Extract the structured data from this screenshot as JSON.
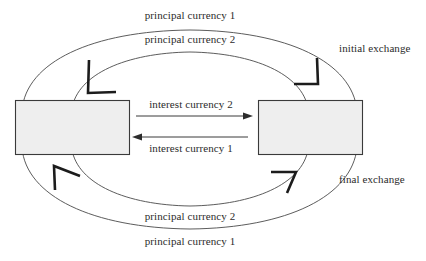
{
  "diagram": {
    "background_color": "#ffffff",
    "nodes": [
      {
        "id": "party-left",
        "label": "",
        "fill": "#eeeeee",
        "stroke": "#3a3a3a"
      },
      {
        "id": "party-right",
        "label": "",
        "fill": "#eeeeee",
        "stroke": "#3a3a3a"
      }
    ],
    "labels": {
      "top_outer": "principal currency 1",
      "top_inner": "principal currency 2",
      "center_upper": "interest currency 2",
      "center_lower": "interest currency 1",
      "bottom_inner": "principal currency 2",
      "bottom_outer": "principal currency 1",
      "right_upper": "initial exchange",
      "right_lower": "final exchange"
    },
    "arrows": [
      {
        "id": "interest-2-right",
        "label": "interest currency 2",
        "direction": "right",
        "style": "straight"
      },
      {
        "id": "interest-1-left",
        "label": "interest currency 1",
        "direction": "left",
        "style": "straight"
      },
      {
        "id": "principal-1-initial",
        "label": "principal currency 1",
        "direction": "to-left-node",
        "style": "curved-outer-top"
      },
      {
        "id": "principal-2-initial",
        "label": "principal currency 2",
        "direction": "to-left-node",
        "style": "curved-inner-top"
      },
      {
        "id": "principal-1-final",
        "label": "principal currency 1",
        "direction": "to-left-node",
        "style": "curved-outer-bottom"
      },
      {
        "id": "principal-2-final",
        "label": "principal currency 2",
        "direction": "to-right-node",
        "style": "curved-inner-bottom"
      }
    ]
  }
}
